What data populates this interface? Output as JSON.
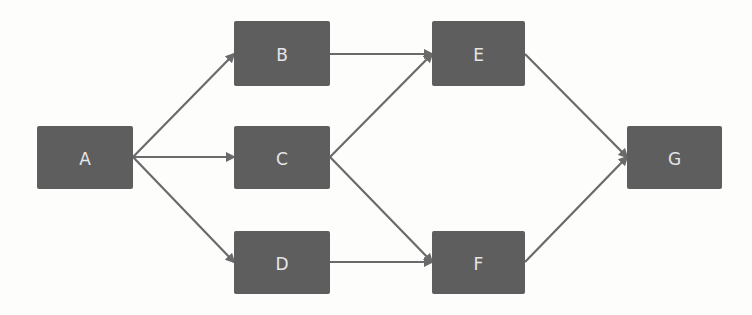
{
  "diagram": {
    "type": "directed-graph",
    "background": "#fdfdfc",
    "node_color": "#5e5e5e",
    "label_color": "#e6e6e6",
    "edge_color": "#6a6a6a",
    "nodes": [
      {
        "id": "A",
        "label": "A",
        "x": 37,
        "y": 126,
        "w": 96,
        "h": 63
      },
      {
        "id": "B",
        "label": "B",
        "x": 234,
        "y": 21,
        "w": 96,
        "h": 65
      },
      {
        "id": "C",
        "label": "C",
        "x": 234,
        "y": 126,
        "w": 96,
        "h": 63
      },
      {
        "id": "D",
        "label": "D",
        "x": 234,
        "y": 231,
        "w": 96,
        "h": 63
      },
      {
        "id": "E",
        "label": "E",
        "x": 432,
        "y": 21,
        "w": 93,
        "h": 65
      },
      {
        "id": "F",
        "label": "F",
        "x": 432,
        "y": 231,
        "w": 93,
        "h": 63
      },
      {
        "id": "G",
        "label": "G",
        "x": 627,
        "y": 126,
        "w": 95,
        "h": 63
      }
    ],
    "edges": [
      {
        "from": "A",
        "to": "B",
        "x1": 133,
        "y1": 157,
        "x2": 234,
        "y2": 54
      },
      {
        "from": "A",
        "to": "C",
        "x1": 133,
        "y1": 157,
        "x2": 234,
        "y2": 157
      },
      {
        "from": "A",
        "to": "D",
        "x1": 133,
        "y1": 157,
        "x2": 234,
        "y2": 262
      },
      {
        "from": "B",
        "to": "E",
        "x1": 330,
        "y1": 54,
        "x2": 432,
        "y2": 54
      },
      {
        "from": "C",
        "to": "E",
        "x1": 330,
        "y1": 157,
        "x2": 432,
        "y2": 54
      },
      {
        "from": "C",
        "to": "F",
        "x1": 330,
        "y1": 157,
        "x2": 432,
        "y2": 262
      },
      {
        "from": "D",
        "to": "F",
        "x1": 330,
        "y1": 262,
        "x2": 432,
        "y2": 262
      },
      {
        "from": "E",
        "to": "G",
        "x1": 525,
        "y1": 54,
        "x2": 627,
        "y2": 157
      },
      {
        "from": "F",
        "to": "G",
        "x1": 525,
        "y1": 262,
        "x2": 627,
        "y2": 157
      }
    ]
  }
}
